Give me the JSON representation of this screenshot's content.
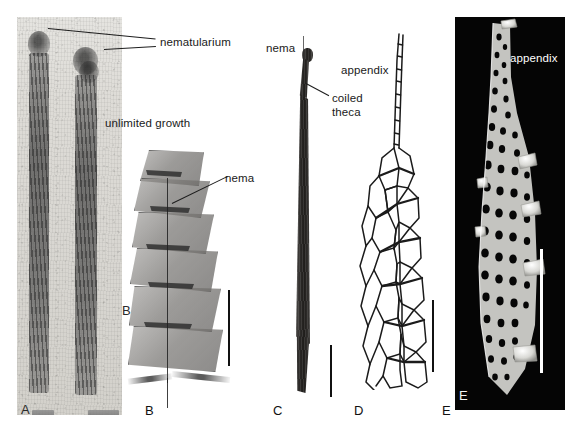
{
  "figure": {
    "kind": "multi-panel scientific plate",
    "background_color": "#ffffff",
    "panel_count": 5
  },
  "annotations": {
    "nematularium": "nematularium",
    "unlimited_growth": "unlimited growth",
    "nema_b": "nema",
    "nema_c": "nema",
    "coiled_theca": "coiled\ntheca",
    "coiled_theca_line1": "coiled",
    "coiled_theca_line2": "theca",
    "appendix_d": "appendix",
    "appendix_e": "appendix"
  },
  "panels": [
    {
      "id": "A",
      "letter": "A",
      "letter_inside": "A",
      "type": "photograph",
      "description": "grainy light-toned fossil slab with two dark vertical rhabdosomes",
      "background": "#ded c d7",
      "has_scalebar": false,
      "labels": [
        "nematularium"
      ]
    },
    {
      "id": "B",
      "letter": "B",
      "letter_inside": "B",
      "type": "photograph",
      "description": "transmitted-light view of stacked thecae with central nema",
      "has_scalebar": true,
      "labels": [
        "unlimited growth",
        "nema"
      ]
    },
    {
      "id": "C",
      "letter": "C",
      "type": "photograph",
      "description": "dark slender elongate specimen with coiled theca at apex",
      "has_scalebar": true,
      "labels": [
        "nema",
        "coiled theca"
      ]
    },
    {
      "id": "D",
      "letter": "D",
      "type": "line-drawing",
      "description": "reconstructed meshwork skeleton tapering to an appendix",
      "has_scalebar": true,
      "labels": [
        "appendix"
      ]
    },
    {
      "id": "E",
      "letter": "E",
      "type": "SEM-micrograph",
      "description": "white fusellar meshwork specimen on black field",
      "background": "#050505",
      "has_scalebar": true,
      "scalebar_color": "#ffffff",
      "labels": [
        "appendix"
      ]
    }
  ],
  "colors": {
    "page_background": "#ffffff",
    "text": "#1a1a1a",
    "text_on_black": "#ffffff",
    "leader_line": "#1d1d1d",
    "scalebar": "#111111",
    "scalebar_white": "#ffffff",
    "sem_field": "#050505"
  }
}
